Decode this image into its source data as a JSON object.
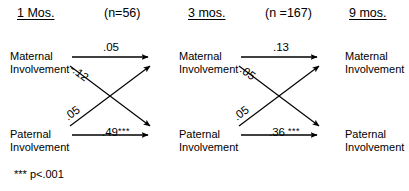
{
  "figure": {
    "type": "cross-lagged-panel-path-diagram",
    "background_color": "#ffffff",
    "line_color": "#000000"
  },
  "waves": [
    {
      "id": "wave-1",
      "label": "1 Mos."
    },
    {
      "id": "wave-3",
      "label": "3 mos."
    },
    {
      "id": "wave-9",
      "label": "9 mos."
    }
  ],
  "sample_notes": [
    {
      "id": "n-wave-1-3",
      "label": "(n=56)"
    },
    {
      "id": "n-wave-3-9",
      "label": "(n =167)"
    }
  ],
  "nodes": [
    {
      "id": "maternal-1",
      "line1": "Maternal",
      "line2": "Involvement"
    },
    {
      "id": "maternal-3",
      "line1": "Maternal",
      "line2": "Involvement"
    },
    {
      "id": "maternal-9",
      "line1": "Maternal",
      "line2": "Involvement"
    },
    {
      "id": "paternal-1",
      "line1": "Paternal",
      "line2": "Involvement"
    },
    {
      "id": "paternal-3",
      "line1": "Paternal",
      "line2": "Involvement"
    },
    {
      "id": "paternal-9",
      "line1": "Paternal",
      "line2": "Involvement"
    }
  ],
  "paths": [
    {
      "id": "maternal-1-to-maternal-3",
      "from": "maternal-1",
      "to": "maternal-3",
      "kind": "autoregressive",
      "coefficient": ".05",
      "stars": "",
      "significant": false
    },
    {
      "id": "maternal-1-to-paternal-3",
      "from": "maternal-1",
      "to": "paternal-3",
      "kind": "cross-lagged",
      "coefficient": "-.12",
      "stars": "",
      "significant": false
    },
    {
      "id": "paternal-1-to-maternal-3",
      "from": "paternal-1",
      "to": "maternal-3",
      "kind": "cross-lagged",
      "coefficient": ".05",
      "stars": "",
      "significant": false
    },
    {
      "id": "paternal-1-to-paternal-3",
      "from": "paternal-1",
      "to": "paternal-3",
      "kind": "autoregressive",
      "coefficient": ".49",
      "stars": "***",
      "significant": true
    },
    {
      "id": "maternal-3-to-maternal-9",
      "from": "maternal-3",
      "to": "maternal-9",
      "kind": "autoregressive",
      "coefficient": ".13",
      "stars": "",
      "significant": false
    },
    {
      "id": "maternal-3-to-paternal-9",
      "from": "maternal-3",
      "to": "paternal-9",
      "kind": "cross-lagged",
      "coefficient": ".05",
      "stars": "",
      "significant": false
    },
    {
      "id": "paternal-3-to-maternal-9",
      "from": "paternal-3",
      "to": "maternal-9",
      "kind": "cross-lagged",
      "coefficient": ".05",
      "stars": "",
      "significant": false
    },
    {
      "id": "paternal-3-to-paternal-9",
      "from": "paternal-3",
      "to": "paternal-9",
      "kind": "autoregressive",
      "coefficient": ".36",
      "stars": "***",
      "significant": true
    }
  ],
  "footnote": {
    "label": "*** p<.001"
  }
}
